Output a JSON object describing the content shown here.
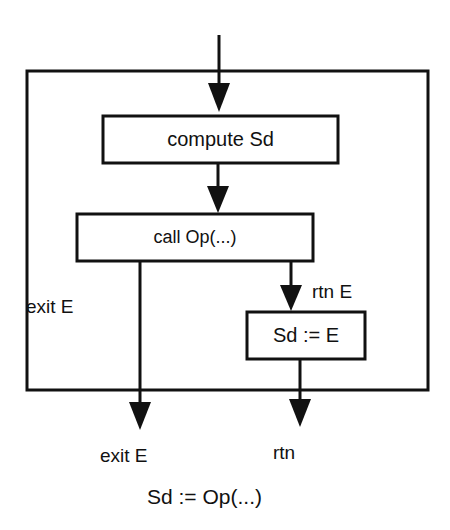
{
  "diagram": {
    "type": "flowchart",
    "boxes": {
      "compute": {
        "label": "compute Sd"
      },
      "call": {
        "label": "call Op(...)"
      },
      "assign": {
        "label": "Sd := E"
      }
    },
    "edges": {
      "entry": {
        "from": "entry",
        "to": "compute"
      },
      "compute_to_call": {
        "from": "compute",
        "to": "call"
      },
      "call_exit": {
        "from": "call",
        "to": "exit",
        "label": "exit E"
      },
      "call_rtn": {
        "from": "call",
        "to": "assign",
        "label": "rtn E"
      },
      "assign_rtn": {
        "from": "assign",
        "to": "rtn"
      }
    },
    "outputs": {
      "exit": {
        "label": "exit E"
      },
      "rtn": {
        "label": "rtn"
      }
    },
    "caption": "Sd := Op(...)",
    "colors": {
      "stroke": "#111111",
      "background": "#ffffff"
    }
  }
}
